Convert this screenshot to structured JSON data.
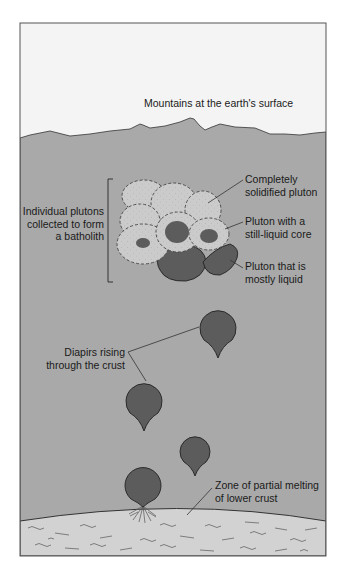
{
  "figure": {
    "colors": {
      "sky": "#f4f4f4",
      "crust": "#a9a9a9",
      "solid_pluton": "#cbcbcb",
      "liquid": "#5c5c5c",
      "lower_crust": "#d2d2d2",
      "line": "#333333"
    }
  },
  "labels": {
    "surface": "Mountains at the earth's surface",
    "batholith": [
      "Individual plutons",
      "collected to form",
      "a batholith"
    ],
    "solidified": [
      "Completely",
      "solidified pluton"
    ],
    "liquid_core": [
      "Pluton with a",
      "still-liquid core"
    ],
    "mostly_liquid": [
      "Pluton that is",
      "mostly liquid"
    ],
    "diapirs": [
      "Diapirs rising",
      "through the crust"
    ],
    "melting_zone": [
      "Zone of partial melting",
      "of lower crust"
    ]
  }
}
